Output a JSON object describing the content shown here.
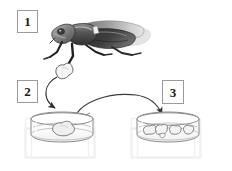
{
  "figure": {
    "background_color": "#ffffff",
    "width": 232,
    "height": 171
  },
  "steps": [
    {
      "id": "step-1",
      "label": "1",
      "describes": "leafhopper-insect",
      "box": {
        "x": 17,
        "y": 10,
        "w": 21,
        "h": 23
      }
    },
    {
      "id": "step-2",
      "label": "2",
      "describes": "explant-in-petri-dish",
      "box": {
        "x": 17,
        "y": 80,
        "w": 21,
        "h": 23
      }
    },
    {
      "id": "step-3",
      "label": "3",
      "describes": "multiplied-cultures-in-petri-dish",
      "box": {
        "x": 162,
        "y": 80,
        "w": 22,
        "h": 24
      }
    }
  ],
  "illustration": {
    "insect": {
      "name": "leafhopper",
      "orientation": "facing-left",
      "body_color": "#4a4a4a",
      "wing_color": "#8f8f8f",
      "wing_tip_color": "#d8d8d8",
      "outline_color": "#2e2e2e"
    },
    "tissue_blob": {
      "name": "excised-tissue-explant",
      "fill_color": "#f2f2f2",
      "outline_color": "#6b6b6b"
    },
    "dish_left": {
      "name": "petri-dish-with-explant",
      "contents_count": 1,
      "fill_color": "#fbfbfb",
      "outline_color": "#8a8a8a",
      "shadow_box_color": "#ededed"
    },
    "dish_right": {
      "name": "petri-dish-with-multiplied-cultures",
      "contents_count": 4,
      "fill_color": "#fbfbfb",
      "outline_color": "#8a8a8a",
      "shadow_box_color": "#ededed"
    },
    "arrows": [
      {
        "name": "arrow-insect-to-left-dish",
        "from": "tissue-blob",
        "to": "petri-dish-with-explant",
        "color": "#3a3a3a",
        "style": "curved-hooked"
      },
      {
        "name": "arrow-left-dish-to-right-dish",
        "from": "petri-dish-with-explant",
        "to": "petri-dish-with-multiplied-cultures",
        "color": "#3a3a3a",
        "style": "broad-arc"
      },
      {
        "name": "pointer-line-into-left-dish",
        "from": "arc-origin",
        "to": "explant",
        "color": "#555555",
        "style": "thin-leader"
      }
    ]
  },
  "colors": {
    "ink": "#1b1b1b",
    "frame": "#9a9a9a",
    "arrow": "#3a3a3a",
    "glass": "#8a8a8a",
    "faint": "#ededed"
  }
}
